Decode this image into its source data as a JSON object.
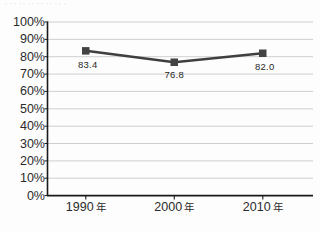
{
  "page": {
    "top_artifact_text": "．．．．．．．．．．．．．．"
  },
  "chart_data": {
    "type": "line",
    "title": "",
    "xlabel": "",
    "ylabel": "",
    "categories": [
      "1990 年",
      "2000 年",
      "2010 年"
    ],
    "values": [
      83.4,
      76.8,
      82.0
    ],
    "point_labels": [
      "83.4",
      "76.8",
      "82.0"
    ],
    "series": [
      {
        "name": "",
        "values": [
          83.4,
          76.8,
          82.0
        ]
      }
    ],
    "ylim": [
      0,
      100
    ],
    "ytick_labels": [
      "100%",
      "90%",
      "80%",
      "70%",
      "60%",
      "50%",
      "40%",
      "30%",
      "20%",
      "10%",
      "0%"
    ],
    "ytick_values": [
      100,
      90,
      80,
      70,
      60,
      50,
      40,
      30,
      20,
      10,
      0
    ],
    "grid": true,
    "legend": "none",
    "colors": {
      "line": "#3f3f3f",
      "marker": "#434343",
      "gridline": "#c9c9c9",
      "axis": "#1a1a1a",
      "text": "#2b2b2b",
      "background": "#fdfdfd"
    }
  }
}
